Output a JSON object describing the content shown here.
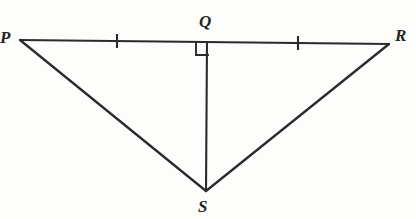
{
  "figure": {
    "kind": "geometry-diagram",
    "width": 416,
    "height": 219,
    "background_color": "#fdfdfb",
    "stroke_color": "#2b2b2b",
    "stroke_width": 2.1,
    "points": {
      "P": {
        "label": "P",
        "x": 20,
        "y": 40
      },
      "Q": {
        "label": "Q",
        "x": 207,
        "y": 42
      },
      "R": {
        "label": "R",
        "x": 389,
        "y": 44
      },
      "S": {
        "label": "S",
        "x": 206,
        "y": 191
      }
    },
    "segments": [
      {
        "name": "PR",
        "from": "P",
        "to": "R"
      },
      {
        "name": "PS",
        "from": "P",
        "to": "S"
      },
      {
        "name": "SR",
        "from": "S",
        "to": "R"
      },
      {
        "name": "QS",
        "from": "Q",
        "to": "S"
      }
    ],
    "tick_marks": [
      {
        "name": "tick-on-PQ",
        "x": 117,
        "y": 41,
        "count": 1
      },
      {
        "name": "tick-on-QR",
        "x": 298,
        "y": 43,
        "count": 1
      }
    ],
    "right_angle": {
      "at": "Q",
      "x": 196,
      "y": 43,
      "size": 12
    }
  }
}
